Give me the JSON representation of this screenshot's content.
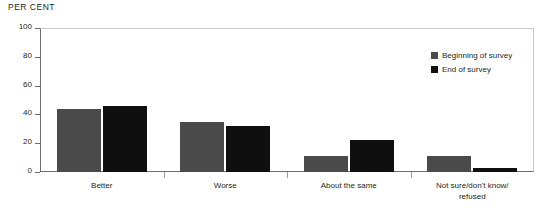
{
  "chart_data": {
    "type": "bar",
    "title": "PER CENT",
    "xlabel": "",
    "ylabel": "PER CENT",
    "ylim": [
      0,
      100
    ],
    "yticks": [
      0,
      20,
      40,
      60,
      80,
      100
    ],
    "grid": false,
    "legend_position": "top-right",
    "categories": [
      "Better",
      "Worse",
      "About the same",
      "Not sure/don't know/refused"
    ],
    "category_lines": [
      [
        "Better"
      ],
      [
        "Worse"
      ],
      [
        "About the same"
      ],
      [
        "Not sure/don't know/",
        "refused"
      ]
    ],
    "series": [
      {
        "name": "Beginning of survey",
        "color": "#4a4a4a",
        "values": [
          44,
          35,
          11,
          11
        ]
      },
      {
        "name": "End of survey",
        "color": "#100f0f",
        "values": [
          46,
          32,
          22,
          3
        ]
      }
    ]
  }
}
